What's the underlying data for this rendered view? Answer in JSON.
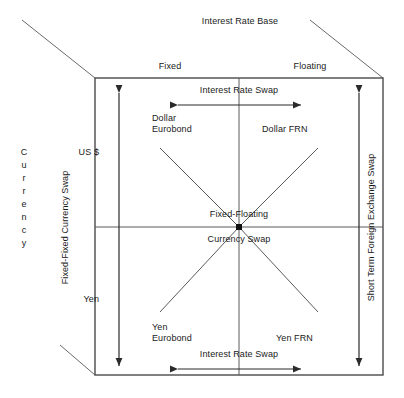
{
  "diagram": {
    "title": "Interest Rate Base",
    "axes": {
      "horizontal_axis_label": "Interest Rate Base",
      "horizontal_categories": [
        "Fixed",
        "Floating"
      ],
      "vertical_axis_label": "Currency",
      "vertical_axis_label_stacked": "C\nu\nr\nr\ne\nn\nc\ny",
      "vertical_categories": [
        "US $",
        "Yen"
      ]
    },
    "quadrants": [
      {
        "id": "top-left",
        "label": "Dollar\nEurobond",
        "line1": "Dollar",
        "line2": "Eurobond"
      },
      {
        "id": "top-right",
        "label": "Dollar FRN",
        "line1": "Dollar FRN",
        "line2": ""
      },
      {
        "id": "bottom-left",
        "label": "Yen\nEurobond",
        "line1": "Yen",
        "line2": "Eurobond"
      },
      {
        "id": "bottom-right",
        "label": "Yen FRN",
        "line1": "Yen FRN",
        "line2": ""
      }
    ],
    "center": {
      "line1": "Fixed-Floating",
      "line2": "Currency Swap"
    },
    "arrows": {
      "top_horizontal": "Interest Rate Swap",
      "bottom_horizontal": "Interest Rate Swap",
      "left_vertical": "Fixed-Fixed Currency Swap",
      "right_vertical": "Short Term Foreign Exchange Swap"
    },
    "colors": {
      "stroke": "#3a3a3a",
      "text": "#1a1a1a",
      "background": "#ffffff"
    }
  }
}
